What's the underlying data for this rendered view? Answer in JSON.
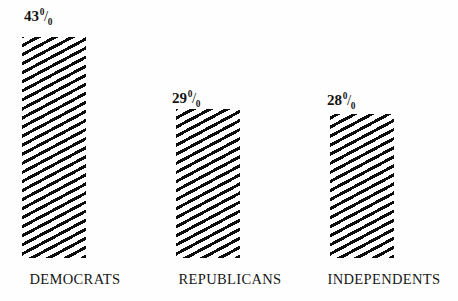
{
  "chart_data": {
    "type": "bar",
    "title": "",
    "subtitle": "",
    "xlabel": "",
    "ylabel": "",
    "ylim": [
      0,
      43
    ],
    "grid": false,
    "legend": false,
    "orientation": "vertical",
    "categories": [
      "DEMOCRATS",
      "REPUBLICANS",
      "INDEPENDENTS"
    ],
    "values": [
      43,
      29,
      28
    ],
    "value_labels": [
      "43%",
      "29%",
      "28%"
    ],
    "value_unit": "%",
    "bar_style": "diagonal-hatch",
    "bar_color": "#0d0d0d",
    "background_color": "#fefefe"
  },
  "bars": [
    {
      "category": "DEMOCRATS",
      "value": 43,
      "value_number": "43",
      "value_unit_numerator": "0",
      "value_unit_slash": "/",
      "value_unit_denominator": "0"
    },
    {
      "category": "REPUBLICANS",
      "value": 29,
      "value_number": "29",
      "value_unit_numerator": "0",
      "value_unit_slash": "/",
      "value_unit_denominator": "0"
    },
    {
      "category": "INDEPENDENTS",
      "value": 28,
      "value_number": "28",
      "value_unit_numerator": "0",
      "value_unit_slash": "/",
      "value_unit_denominator": "0"
    }
  ],
  "layout": {
    "baseline_y": 258,
    "bar_width": 64,
    "bar_left_positions": [
      22,
      176,
      330
    ],
    "bar_tops": [
      37,
      119,
      122
    ],
    "category_label_y": 272,
    "category_label_centers": [
      75,
      230,
      384
    ],
    "value_label_positions": [
      {
        "left": 24,
        "top": 9
      },
      {
        "left": 172,
        "top": 91
      },
      {
        "left": 327,
        "top": 93
      }
    ]
  }
}
